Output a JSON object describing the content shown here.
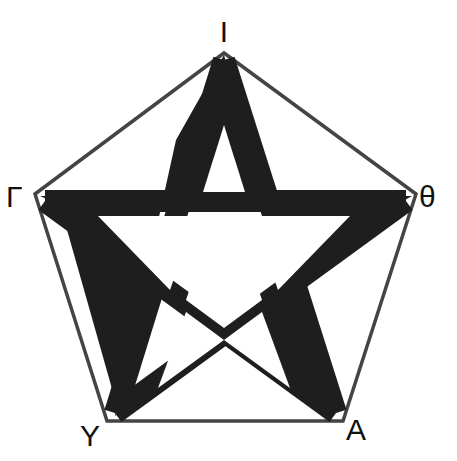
{
  "diagram": {
    "type": "pentagram-in-pentagon",
    "colors": {
      "background": "#ffffff",
      "pentagon_stroke": "#444444",
      "star_fill": "#1e1e1e",
      "label": "#111111"
    },
    "vertices": [
      {
        "id": "top",
        "label": "Ι",
        "x": 224,
        "y": 53
      },
      {
        "id": "right",
        "label": "θ",
        "x": 416,
        "y": 194
      },
      {
        "id": "bottom-right",
        "label": "A",
        "x": 343,
        "y": 421
      },
      {
        "id": "bottom-left",
        "label": "Υ",
        "x": 107,
        "y": 421
      },
      {
        "id": "left",
        "label": "Γ",
        "x": 35,
        "y": 194
      }
    ]
  }
}
